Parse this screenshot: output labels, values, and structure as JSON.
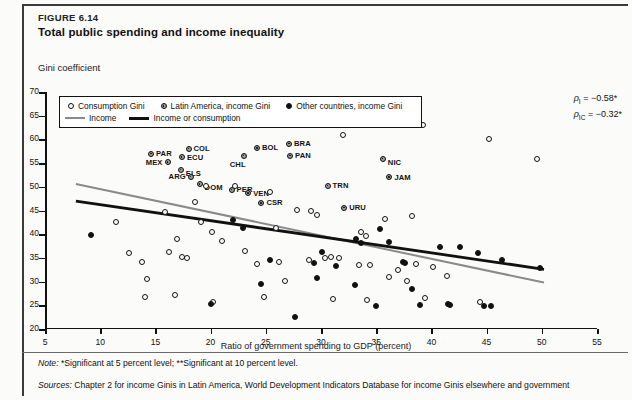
{
  "figure": {
    "number": "FIGURE 6.14",
    "title": "Total public spending and income inequality",
    "ylabel": "Gini coefficient",
    "xlabel": "Ratio of government spending to GDP (percent)",
    "note_label": "Note:",
    "note_text": "*Significant at 5 percent level; **Significant at 10 percent level.",
    "sources_label": "Sources:",
    "sources_text": "Chapter 2 for income Ginis in Latin America, World Development Indicators Database for income Ginis elsewhere and government"
  },
  "legend": {
    "items": [
      {
        "marker": "open-circle",
        "label": "Consumption Gini"
      },
      {
        "marker": "latin-america-circle",
        "label": "Latin America, income Gini"
      },
      {
        "marker": "filled-circle",
        "label": "Other countries, income Gini"
      }
    ],
    "lines": [
      {
        "style": "gray",
        "label": "Income"
      },
      {
        "style": "black",
        "label": "Income or consumption"
      }
    ]
  },
  "annotations": {
    "rho_income": {
      "symbol": "ρ",
      "subscript": "I",
      "value": "= −0.58*"
    },
    "rho_consumption": {
      "symbol": "ρ",
      "subscript": "IC",
      "value": "= −0.32*"
    }
  },
  "chart_data": {
    "type": "scatter",
    "title": "Total public spending and income inequality",
    "xlabel": "Ratio of government spending to GDP (percent)",
    "ylabel": "Gini coefficient",
    "xlim": [
      5,
      55
    ],
    "ylim": [
      20,
      70
    ],
    "xticks": [
      5,
      10,
      15,
      20,
      25,
      30,
      35,
      40,
      45,
      50,
      55
    ],
    "yticks": [
      20,
      25,
      30,
      35,
      40,
      45,
      50,
      55,
      60,
      65,
      70
    ],
    "grid": false,
    "legend_position": "top-left-inside",
    "series": [
      {
        "name": "Latin America, income Gini",
        "marker": "latin-america-circle",
        "points": [
          {
            "label": "PAR",
            "x": 14.6,
            "y": 57.0
          },
          {
            "label": "MEX",
            "x": 16.1,
            "y": 55.2
          },
          {
            "label": "COL",
            "x": 18.0,
            "y": 58.0
          },
          {
            "label": "ECU",
            "x": 17.4,
            "y": 56.2
          },
          {
            "label": "ELS",
            "x": 17.3,
            "y": 53.6
          },
          {
            "label": "ARG",
            "x": 18.2,
            "y": 52.1
          },
          {
            "label": "DOM",
            "x": 19.0,
            "y": 50.6
          },
          {
            "label": "PER",
            "x": 21.9,
            "y": 49.4
          },
          {
            "label": "VEN",
            "x": 23.4,
            "y": 48.6
          },
          {
            "label": "CSR",
            "x": 24.6,
            "y": 46.6
          },
          {
            "label": "CHL",
            "x": 23.0,
            "y": 56.6
          },
          {
            "label": "BOL",
            "x": 24.2,
            "y": 58.2
          },
          {
            "label": "BRA",
            "x": 27.1,
            "y": 59.1
          },
          {
            "label": "PAN",
            "x": 27.2,
            "y": 56.6
          },
          {
            "label": "TRN",
            "x": 30.6,
            "y": 50.2
          },
          {
            "label": "URU",
            "x": 32.1,
            "y": 45.6
          },
          {
            "label": "NIC",
            "x": 35.6,
            "y": 55.9
          },
          {
            "label": "JAM",
            "x": 36.2,
            "y": 52.0
          }
        ]
      },
      {
        "name": "Consumption Gini",
        "marker": "open-circle",
        "points": [
          {
            "x": 9.3,
            "y": 63.2
          },
          {
            "x": 11.4,
            "y": 42.6
          },
          {
            "x": 12.6,
            "y": 36.0
          },
          {
            "x": 13.8,
            "y": 34.2
          },
          {
            "x": 14.2,
            "y": 30.6
          },
          {
            "x": 14.1,
            "y": 26.8
          },
          {
            "x": 15.9,
            "y": 44.6
          },
          {
            "x": 16.2,
            "y": 36.2
          },
          {
            "x": 17.0,
            "y": 39.0
          },
          {
            "x": 17.4,
            "y": 35.2
          },
          {
            "x": 17.9,
            "y": 35.0
          },
          {
            "x": 16.8,
            "y": 27.2
          },
          {
            "x": 18.6,
            "y": 46.8
          },
          {
            "x": 19.1,
            "y": 42.6
          },
          {
            "x": 19.6,
            "y": 50.1
          },
          {
            "x": 20.1,
            "y": 40.4
          },
          {
            "x": 20.2,
            "y": 25.6
          },
          {
            "x": 21.0,
            "y": 38.6
          },
          {
            "x": 22.2,
            "y": 50.2
          },
          {
            "x": 23.1,
            "y": 36.5
          },
          {
            "x": 24.2,
            "y": 33.8
          },
          {
            "x": 24.8,
            "y": 26.8
          },
          {
            "x": 25.4,
            "y": 48.8
          },
          {
            "x": 25.9,
            "y": 41.3
          },
          {
            "x": 26.2,
            "y": 34.2
          },
          {
            "x": 26.7,
            "y": 30.1
          },
          {
            "x": 27.8,
            "y": 45.2
          },
          {
            "x": 28.9,
            "y": 34.6
          },
          {
            "x": 29.1,
            "y": 44.8
          },
          {
            "x": 29.6,
            "y": 44.0
          },
          {
            "x": 30.4,
            "y": 35.0
          },
          {
            "x": 30.9,
            "y": 35.2
          },
          {
            "x": 31.6,
            "y": 34.9
          },
          {
            "x": 31.1,
            "y": 26.4
          },
          {
            "x": 32.0,
            "y": 61.0
          },
          {
            "x": 33.4,
            "y": 33.4
          },
          {
            "x": 33.6,
            "y": 40.4
          },
          {
            "x": 34.1,
            "y": 39.6
          },
          {
            "x": 34.2,
            "y": 26.2
          },
          {
            "x": 34.4,
            "y": 33.5
          },
          {
            "x": 35.8,
            "y": 43.2
          },
          {
            "x": 36.2,
            "y": 30.9
          },
          {
            "x": 37.0,
            "y": 32.4
          },
          {
            "x": 37.8,
            "y": 30.2
          },
          {
            "x": 38.2,
            "y": 43.9
          },
          {
            "x": 38.6,
            "y": 33.8
          },
          {
            "x": 39.2,
            "y": 63.0
          },
          {
            "x": 39.4,
            "y": 26.6
          },
          {
            "x": 41.4,
            "y": 31.2
          },
          {
            "x": 44.4,
            "y": 25.8
          },
          {
            "x": 45.2,
            "y": 60.0
          },
          {
            "x": 49.6,
            "y": 55.8
          },
          {
            "x": 40.1,
            "y": 33.0
          }
        ]
      },
      {
        "name": "Other countries, income Gini",
        "marker": "filled-circle",
        "points": [
          {
            "x": 9.2,
            "y": 39.8
          },
          {
            "x": 20.0,
            "y": 25.2
          },
          {
            "x": 22.0,
            "y": 43.0
          },
          {
            "x": 22.9,
            "y": 41.4
          },
          {
            "x": 24.6,
            "y": 29.4
          },
          {
            "x": 25.4,
            "y": 34.6
          },
          {
            "x": 27.6,
            "y": 22.6
          },
          {
            "x": 29.4,
            "y": 34.0
          },
          {
            "x": 29.6,
            "y": 30.8
          },
          {
            "x": 30.1,
            "y": 36.2
          },
          {
            "x": 33.2,
            "y": 39.0
          },
          {
            "x": 33.6,
            "y": 38.2
          },
          {
            "x": 33.1,
            "y": 29.2
          },
          {
            "x": 35.3,
            "y": 41.0
          },
          {
            "x": 36.2,
            "y": 38.4
          },
          {
            "x": 37.4,
            "y": 34.2
          },
          {
            "x": 37.6,
            "y": 33.9
          },
          {
            "x": 38.2,
            "y": 28.4
          },
          {
            "x": 39.0,
            "y": 25.1
          },
          {
            "x": 40.8,
            "y": 37.4
          },
          {
            "x": 41.5,
            "y": 25.2
          },
          {
            "x": 41.7,
            "y": 25.1
          },
          {
            "x": 42.6,
            "y": 37.4
          },
          {
            "x": 44.2,
            "y": 36.0
          },
          {
            "x": 44.8,
            "y": 24.9
          },
          {
            "x": 45.4,
            "y": 24.9
          },
          {
            "x": 46.4,
            "y": 34.6
          },
          {
            "x": 49.8,
            "y": 32.8
          },
          {
            "x": 35.0,
            "y": 24.9
          },
          {
            "x": 31.4,
            "y": 33.2
          }
        ]
      }
    ],
    "trend_lines": [
      {
        "name": "Income",
        "style": "gray",
        "x0": 7.8,
        "y0": 50.6,
        "x1": 50.2,
        "y1": 29.8
      },
      {
        "name": "Income or consumption",
        "style": "black",
        "x0": 7.8,
        "y0": 47.0,
        "x1": 50.2,
        "y1": 32.6
      }
    ]
  }
}
